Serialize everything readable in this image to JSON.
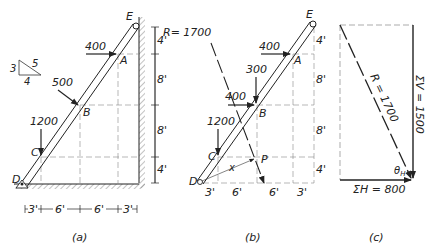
{
  "slope_triangle": {
    "rise": "3",
    "hyp": "5",
    "run": "4"
  },
  "panel_a": {
    "caption": "(a)",
    "points": {
      "D": "D",
      "C": "C",
      "B": "B",
      "A": "A",
      "E": "E"
    },
    "loads": {
      "at_A": "400",
      "at_B": "500",
      "at_C": "1200"
    },
    "horizontal_dims": [
      "3'",
      "6'",
      "6'",
      "3'"
    ],
    "vertical_dims": [
      "4'",
      "8'",
      "8'",
      "4'"
    ]
  },
  "panel_b": {
    "caption": "(b)",
    "resultant_label": "R= 1700",
    "points": {
      "D": "D",
      "C": "C",
      "B": "B",
      "A": "A",
      "E": "E",
      "P": "P"
    },
    "loads": {
      "at_A_h": "400",
      "at_B_v": "300",
      "at_B_h": "400",
      "at_C": "1200"
    },
    "distance_label": "x",
    "horizontal_dims": [
      "3'",
      "6'",
      "6'",
      "3'"
    ],
    "vertical_dims": [
      "4'",
      "8'",
      "8'",
      "4'"
    ]
  },
  "panel_c": {
    "caption": "(c)",
    "resultant_label": "R = 1700",
    "sum_v_label": "ΣV = 1500",
    "sum_h_label": "ΣH = 800",
    "angle_label": "θ",
    "angle_sub": "H"
  },
  "colors": {
    "line": "#222222",
    "hatch": "#555555",
    "dash": "#777777"
  }
}
